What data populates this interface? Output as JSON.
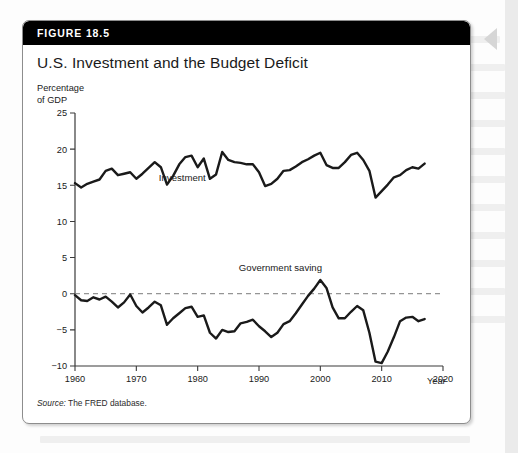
{
  "figure": {
    "number_label": "FIGURE 18.5",
    "title": "U.S. Investment and the Budget Deficit",
    "source_prefix": "Source:",
    "source_text": " The FRED database."
  },
  "axes": {
    "y_axis_label": "Percentage\nof GDP",
    "x_axis_label": "Year"
  },
  "icons": {
    "page-arrow-icon": "left-pointing-triangle"
  },
  "colors": {
    "header_bar": "#000000",
    "card_background": "#ffffff",
    "card_border": "#8d8d8d",
    "series_line": "#1a1a1a",
    "axis": "#3a3a3a",
    "zero_reference_line": "#7a7a7a"
  },
  "chart_data": {
    "type": "line",
    "title": "U.S. Investment and the Budget Deficit",
    "xlabel": "Year",
    "ylabel": "Percentage of GDP",
    "xlim": [
      1960,
      2020
    ],
    "ylim": [
      -10,
      25
    ],
    "xticks": [
      1960,
      1970,
      1980,
      1990,
      2000,
      2010,
      2020
    ],
    "yticks": [
      25,
      20,
      15,
      10,
      5,
      0,
      -5,
      -10
    ],
    "grid": false,
    "legend": "inline-labels",
    "reference_lines": [
      {
        "name": "zero-line",
        "y": 0,
        "style": "dashed"
      }
    ],
    "annotations": [
      {
        "name": "investment-label",
        "text": "Investment",
        "x": 1977.5,
        "y": 15.6
      },
      {
        "name": "government-saving-label",
        "text": "Government saving",
        "x": 1993.5,
        "y": 3.2
      }
    ],
    "x": [
      1960,
      1961,
      1962,
      1963,
      1964,
      1965,
      1966,
      1967,
      1968,
      1969,
      1970,
      1971,
      1972,
      1973,
      1974,
      1975,
      1976,
      1977,
      1978,
      1979,
      1980,
      1981,
      1982,
      1983,
      1984,
      1985,
      1986,
      1987,
      1988,
      1989,
      1990,
      1991,
      1992,
      1993,
      1994,
      1995,
      1996,
      1997,
      1998,
      1999,
      2000,
      2001,
      2002,
      2003,
      2004,
      2005,
      2006,
      2007,
      2008,
      2009,
      2010,
      2011,
      2012,
      2013,
      2014,
      2015,
      2016,
      2017
    ],
    "series": [
      {
        "name": "Investment",
        "values": [
          15.3,
          14.7,
          15.2,
          15.5,
          15.8,
          17.0,
          17.3,
          16.4,
          16.6,
          16.8,
          15.9,
          16.6,
          17.4,
          18.2,
          17.5,
          15.1,
          16.3,
          17.9,
          18.9,
          19.1,
          17.5,
          18.7,
          15.9,
          16.5,
          19.6,
          18.5,
          18.2,
          18.1,
          17.9,
          17.9,
          16.8,
          14.9,
          15.2,
          15.9,
          17.0,
          17.1,
          17.6,
          18.2,
          18.6,
          19.1,
          19.5,
          17.8,
          17.4,
          17.4,
          18.2,
          19.2,
          19.5,
          18.5,
          17.0,
          13.3,
          14.2,
          15.1,
          16.1,
          16.4,
          17.1,
          17.5,
          17.3,
          18.0
        ]
      },
      {
        "name": "Government saving",
        "values": [
          -0.2,
          -0.9,
          -1.0,
          -0.5,
          -0.8,
          -0.4,
          -1.1,
          -1.9,
          -1.2,
          -0.1,
          -1.7,
          -2.6,
          -1.9,
          -1.1,
          -1.6,
          -4.3,
          -3.4,
          -2.7,
          -2.0,
          -1.8,
          -3.2,
          -3.0,
          -5.4,
          -6.2,
          -5.0,
          -5.3,
          -5.2,
          -4.1,
          -3.9,
          -3.6,
          -4.5,
          -5.2,
          -6.0,
          -5.4,
          -4.2,
          -3.8,
          -2.7,
          -1.5,
          -0.3,
          0.7,
          1.9,
          0.8,
          -1.9,
          -3.4,
          -3.4,
          -2.5,
          -1.7,
          -2.3,
          -5.4,
          -9.4,
          -9.6,
          -8.0,
          -6.0,
          -3.8,
          -3.3,
          -3.2,
          -3.8,
          -3.5
        ]
      }
    ]
  }
}
